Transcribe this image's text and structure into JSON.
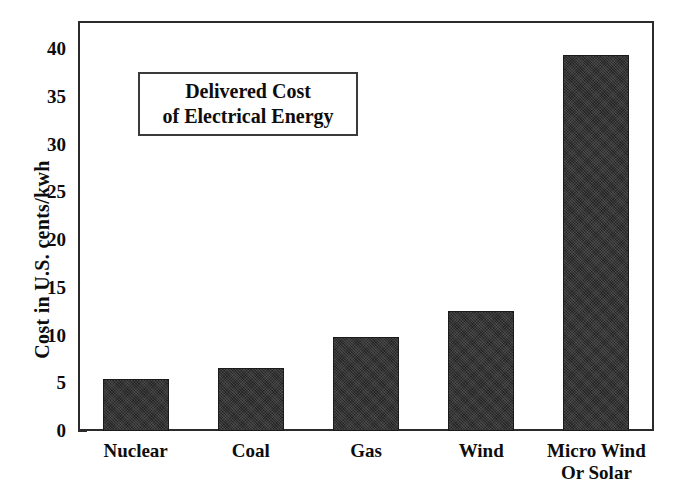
{
  "chart_data": {
    "type": "bar",
    "title": "Delivered Cost of Electrical Energy",
    "title_lines": [
      "Delivered Cost",
      "of Electrical Energy"
    ],
    "categories": [
      "Nuclear",
      "Coal",
      "Gas",
      "Wind",
      "Micro Wind\nOr Solar"
    ],
    "values": [
      5.4,
      6.6,
      9.8,
      12.6,
      39.4
    ],
    "xlabel": "",
    "ylabel": "Cost in U.S. cents/kwh",
    "ylim": [
      0,
      43
    ],
    "yticks": [
      0,
      5,
      10,
      15,
      20,
      25,
      30,
      35,
      40
    ],
    "ytick_labels": [
      "0",
      "5",
      "10",
      "15",
      "20",
      "25",
      "30",
      "35",
      "40"
    ],
    "grid": false,
    "legend": false,
    "bar_color": "#252525",
    "axis_color": "#2b2b2b"
  }
}
